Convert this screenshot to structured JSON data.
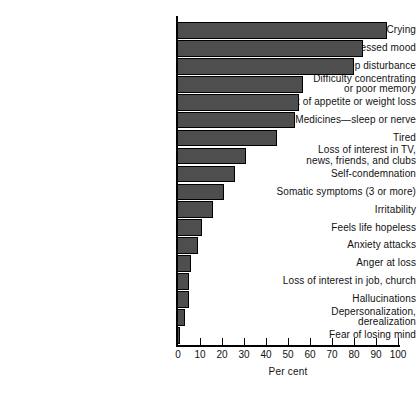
{
  "chart_data": {
    "type": "bar",
    "orientation": "horizontal",
    "title": "",
    "xlabel": "Per cent",
    "ylabel": "",
    "xlim": [
      0,
      100
    ],
    "xticks": [
      0,
      10,
      20,
      30,
      40,
      50,
      60,
      70,
      80,
      90,
      100
    ],
    "grid": false,
    "legend": null,
    "bar_color": "#4e4e4e",
    "bar_edge_color": "#000000",
    "categories": [
      "Crying",
      "Depressed mood",
      "Sleep disturbance",
      "Difficulty concentrating\nor poor memory",
      "Lack of appetite or weight loss",
      "Medicines—sleep or nerve",
      "Tired",
      "Loss of interest in TV,\nnews, friends, and clubs",
      "Self-condemnation",
      "Somatic symptoms (3 or more)",
      "Irritability",
      "Feels life hopeless",
      "Anxiety attacks",
      "Anger at loss",
      "Loss of interest in job, church",
      "Hallucinations",
      "Depersonalization,\nderealization",
      "Fear of losing mind"
    ],
    "values": [
      95,
      84,
      80,
      57,
      55,
      53,
      45,
      31,
      26,
      21,
      16,
      11,
      9,
      6,
      5,
      5,
      3,
      1
    ]
  }
}
